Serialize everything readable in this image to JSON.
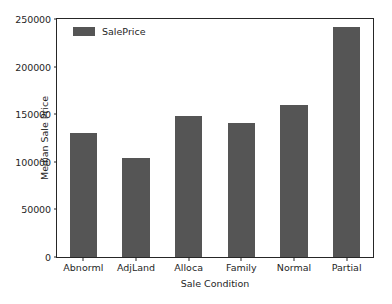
{
  "chart_data": {
    "type": "bar",
    "title": "",
    "subtitle": "",
    "xlabel": "Sale Condition",
    "ylabel": "Median Sale Price",
    "categories": [
      "Abnorml",
      "AdjLand",
      "Alloca",
      "Family",
      "Normal",
      "Partial"
    ],
    "series": [
      {
        "name": "SalePrice",
        "color": "#555555",
        "values": [
          130000,
          104000,
          148000,
          141000,
          160000,
          242000
        ]
      }
    ],
    "ylim": [
      0,
      250000
    ],
    "yticks": [
      0,
      50000,
      100000,
      150000,
      200000,
      250000
    ],
    "ytick_labels": [
      "0",
      "50000",
      "100000",
      "150000",
      "200000",
      "250000"
    ],
    "grid": false,
    "legend": {
      "position": "upper left",
      "entries": [
        {
          "label": "SalePrice",
          "color": "#555555"
        }
      ]
    }
  },
  "figure": {
    "background": "#ffffff",
    "axis_color": "#262626",
    "bar_color": "#555555"
  }
}
